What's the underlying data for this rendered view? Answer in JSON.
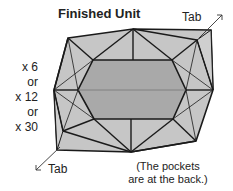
{
  "title": "Finished Unit",
  "tab_top": "Tab",
  "tab_bottom": "Tab",
  "multipliers": [
    "x 6",
    "or",
    "x 12",
    "or",
    "x 30"
  ],
  "note_line1": "(The pockets",
  "note_line2": "are at the back.)",
  "colors": {
    "outer": "#c4c4c4",
    "inner": "#a6a6a6",
    "stroke": "#1a1a1a"
  }
}
